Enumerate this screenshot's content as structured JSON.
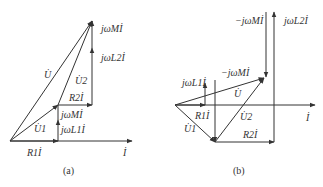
{
  "figure_a": {
    "caption": "(a)",
    "labels": {
      "U": "U̇",
      "U2": "U̇2",
      "U1": "U̇1",
      "jwM_top": "jωMİ",
      "jwL2": "jωL2İ",
      "R2I": "R2İ",
      "jwM_mid": "jωMİ",
      "jwL1": "jωL1İ",
      "R1I": "R1İ",
      "I": "İ"
    }
  },
  "figure_b": {
    "caption": "(b)",
    "labels": {
      "neg_jwM_top": "−jωMİ",
      "jwL2": "jωL2İ",
      "neg_jwM_mid": "−jωMİ",
      "jwL1": "jωL1İ",
      "U": "U̇",
      "R1I": "R1İ",
      "U2": "U̇2",
      "U1": "U̇1",
      "R2I": "R2İ",
      "I": "İ"
    }
  },
  "colors": {
    "line": "#333333",
    "background": "#ffffff"
  }
}
